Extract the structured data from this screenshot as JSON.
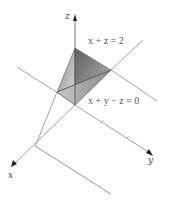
{
  "diagram": {
    "type": "3d-coordinate-sketch",
    "axes": {
      "x_label": "x",
      "y_label": "y",
      "z_label": "z"
    },
    "planes": [
      {
        "equation": "x + z = 2"
      },
      {
        "equation": "x + y − z = 0"
      }
    ],
    "solid": "tetrahedron",
    "colors": {
      "axis": "#555555",
      "line": "#777777",
      "solid_dark": "#6e6e6e",
      "solid_light": "#d6d6d6",
      "text": "#444444"
    }
  }
}
